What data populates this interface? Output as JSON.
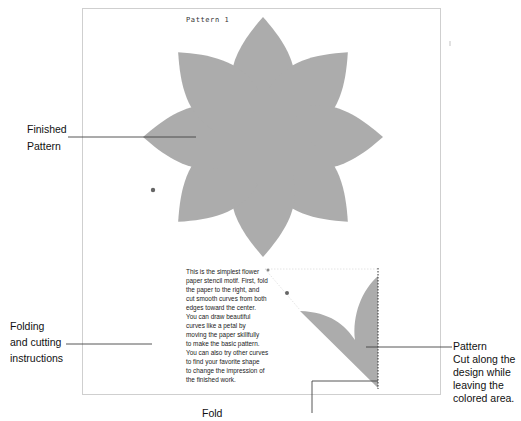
{
  "figure": {
    "pattern_title": "Pattern 1",
    "colors": {
      "petal_fill": "#acacac",
      "frame_border": "#cfcfcf",
      "leader_line": "#444444",
      "text": "#111111"
    },
    "flower": {
      "petal_count": 8
    }
  },
  "callouts": {
    "finished_pattern": {
      "line1": "Finished",
      "line2": "Pattern"
    },
    "folding": {
      "line1": "Folding",
      "line2": "and cutting",
      "line3": "instructions"
    },
    "fold": "Fold",
    "pattern": {
      "title": "Pattern",
      "line1": "Cut along the",
      "line2": "design while",
      "line3": "leaving the",
      "line4": "colored area."
    }
  },
  "instructions": {
    "lines": [
      "This is the simplest flower",
      "paper stencil motif. First, fold",
      "the paper to the right, and",
      "cut smooth curves from both",
      "edges toward the center.",
      "You can draw beautiful",
      "curves like a petal by",
      "moving the paper skillfully",
      "to make the basic pattern.",
      "You can also try other curves",
      "to find your favorite shape",
      "to change the impression of",
      "the finished work."
    ]
  }
}
